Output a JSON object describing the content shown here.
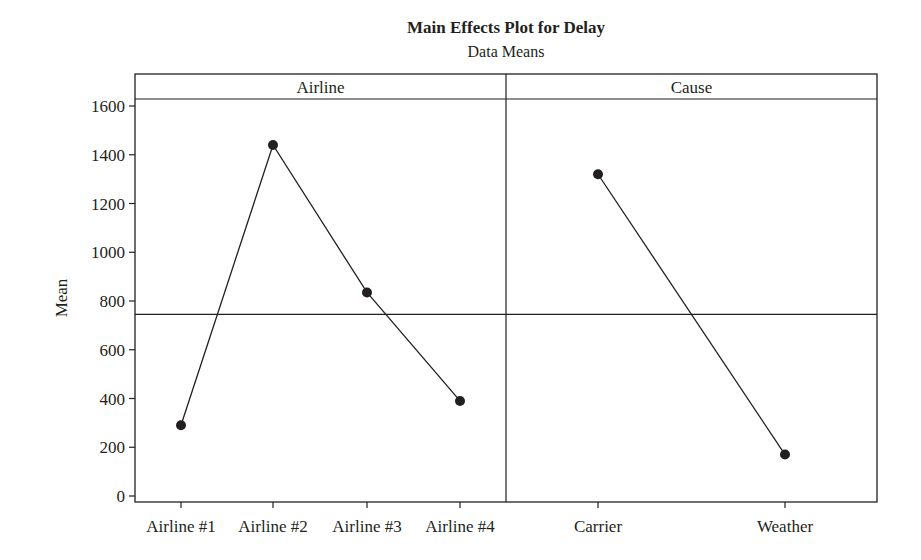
{
  "chart_data": {
    "type": "line",
    "title": "Main Effects Plot for Delay",
    "subtitle": "Data Means",
    "ylabel": "Mean",
    "ylim": [
      0,
      1600
    ],
    "yticks": [
      0,
      200,
      400,
      600,
      800,
      1000,
      1200,
      1400,
      1600
    ],
    "grid": false,
    "reference_line": 745,
    "panels": [
      {
        "name": "Airline",
        "categories": [
          "Airline #1",
          "Airline #2",
          "Airline #3",
          "Airline #4"
        ],
        "values": [
          290,
          1440,
          835,
          390
        ]
      },
      {
        "name": "Cause",
        "categories": [
          "Carrier",
          "Weather"
        ],
        "values": [
          1320,
          170
        ]
      }
    ]
  },
  "colors": {
    "ink": "#231f20",
    "background": "#ffffff"
  }
}
